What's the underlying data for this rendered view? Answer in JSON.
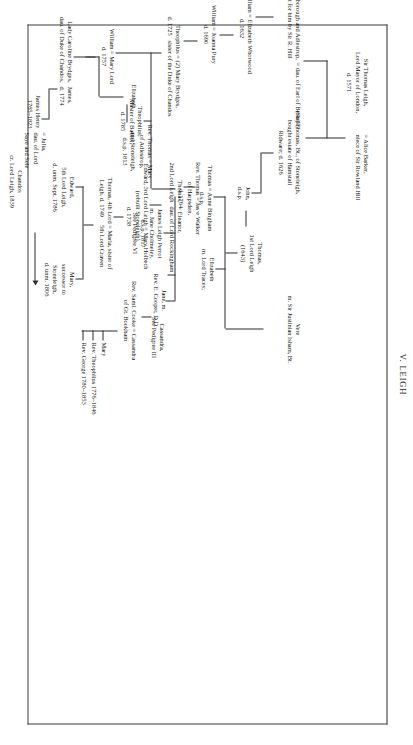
{
  "plate": {
    "title": "V. LEIGH"
  },
  "nodes": {
    "sir_thomas_leigh": "Sir Thomas Leigh,\nLord Mayor of London,\nd. 1571",
    "alice_barker": "= Alice Barker,\nniece of Sir Rowland Hill",
    "rowland": "Rowland of Longborough and Adlestrop,\nbought for him by Sir R. Hill",
    "rowland_wife": "= dau. of Earl of Berkeley",
    "sir_thomas_bt": "(Sir) Thomas, Bt., of Stoneleigh,\nbought estate of Hamstall\nRidware; d. 1626",
    "sir_william": "Sir William = Elizabeth Whorwood\nd. 1632",
    "john_dsp": "John,\nd.s.p.",
    "thomas_1st_lord": "Thomas,\n1st Lord Leigh\n(1643)",
    "william_1690": "William = Joanna Pury\nd. 1690",
    "thomas_anne": "Thomas = Anne Bingham\nd.s.p.",
    "elizabeth_tracey": "Elizabeth\nm. Lord Tracey,",
    "vere": "Vere\nm. Sir Justinian Isham, Bt.",
    "thomas_2nd_lord": "Thomas,\n2nd Lord Leigh",
    "eleanor": "= Eleanor,\ndau. of Lord Rockingham",
    "theophilus_1725": "Theophilus = (2) Mary Brydges,\nd. 1725   sister of the Duke of Chandos",
    "edward_3rd_lord": "Edward, 3rd Lord Leigh = Mary Holbech\n(rebuilt Stoneleigh).\nd. 1738",
    "theophilus_balliol": "Theophilus,\nMaster of Balliol,\nd. 1785",
    "rev_thomas_walker": "Rev. Thomas = Jas·e Walker\nof Harpsden,\nd. 1764",
    "thomas_4th_lord": "Thomas, 4th Lord = Maria, sister of\nLeigh. d. 1749     5th Lord Craven",
    "edward_5th_lord": "Edward,\n5th Lord Leigh,\nd. unm. Sept. 1786",
    "mary_successor": "Mary,\nsuccessor to\nStoneleigh,\nd. unm. 1806",
    "william_1757": "William = Mary Lord\nd. 1757",
    "james_1774": "James,\nd. 1774",
    "elizabeth_b": "Elizabeth",
    "rev_thomas_adlestrop": "Rev. Thomas = Mary\nof Adlestrop,\nand Stoneleigh,\nd.s.p. 1813",
    "james_leigh_perrot": "James Leigh Perrot\nm. Jane Cholmeley,\nd.s.p. 1817\nSee Pedigree VI",
    "jane_m": "Jane, m.\nRev. E. Cooper, D.D.",
    "cassandra_cooke": "Cassandra,\nSee Pedigree III",
    "rev_saml_cooke": "Rev. Saml. Cooke = Cassandra\nof Gt. Bookham",
    "cooke_children_1": "Mary",
    "cooke_children_2": "Rev. Theophilus 1776–1846",
    "cooke_children_3": "Rev. George 1780–1853",
    "lady_caroline": "Lady Caroline Brydges,\ndau. of Duke of Chandos,",
    "james_henry": "James Henry\n1765–1823",
    "julia": "= Julia,\ndau. of Lord\nSaye and Sele",
    "chandos": "Chandos\ncr. Lord Leigh, 1839"
  }
}
